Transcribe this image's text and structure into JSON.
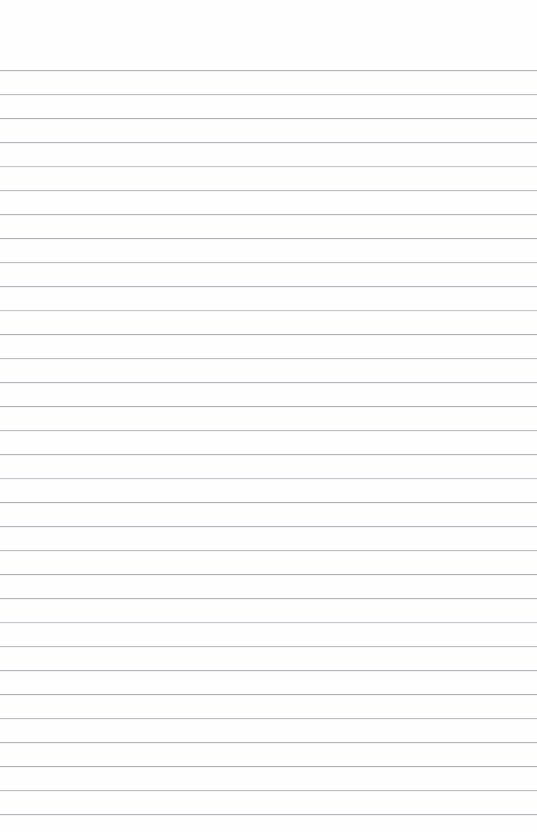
{
  "page": {
    "kind": "ruled-notebook-page",
    "width": 537,
    "height": 832,
    "background_color": "#fefefe",
    "content_text": "",
    "has_written_content": false
  },
  "ruling": {
    "line_color": "#b3b7bb",
    "line_thickness_px": 1,
    "line_spacing_px": 24,
    "first_line_y_px": 70,
    "last_line_y_px": 814,
    "line_count": 32,
    "line_left_x_px": 0,
    "line_right_x_px": 537,
    "top_margin_px": 68,
    "bottom_margin_px": 18,
    "lines": [
      {
        "index": 1,
        "y": 70,
        "tone": "tone-a"
      },
      {
        "index": 2,
        "y": 94,
        "tone": "tone-b"
      },
      {
        "index": 3,
        "y": 118,
        "tone": "tone-c"
      },
      {
        "index": 4,
        "y": 142,
        "tone": "tone-a"
      },
      {
        "index": 5,
        "y": 166,
        "tone": "tone-d"
      },
      {
        "index": 6,
        "y": 190,
        "tone": "tone-b"
      },
      {
        "index": 7,
        "y": 214,
        "tone": "tone-a"
      },
      {
        "index": 8,
        "y": 238,
        "tone": "tone-c"
      },
      {
        "index": 9,
        "y": 262,
        "tone": "tone-b"
      },
      {
        "index": 10,
        "y": 286,
        "tone": "tone-a"
      },
      {
        "index": 11,
        "y": 310,
        "tone": "tone-d"
      },
      {
        "index": 12,
        "y": 334,
        "tone": "tone-c"
      },
      {
        "index": 13,
        "y": 358,
        "tone": "tone-b"
      },
      {
        "index": 14,
        "y": 382,
        "tone": "tone-a"
      },
      {
        "index": 15,
        "y": 406,
        "tone": "tone-c"
      },
      {
        "index": 16,
        "y": 430,
        "tone": "tone-b"
      },
      {
        "index": 17,
        "y": 454,
        "tone": "tone-a"
      },
      {
        "index": 18,
        "y": 478,
        "tone": "tone-d"
      },
      {
        "index": 19,
        "y": 502,
        "tone": "tone-c"
      },
      {
        "index": 20,
        "y": 526,
        "tone": "tone-a"
      },
      {
        "index": 21,
        "y": 550,
        "tone": "tone-b"
      },
      {
        "index": 22,
        "y": 574,
        "tone": "tone-c"
      },
      {
        "index": 23,
        "y": 598,
        "tone": "tone-a"
      },
      {
        "index": 24,
        "y": 622,
        "tone": "tone-d"
      },
      {
        "index": 25,
        "y": 646,
        "tone": "tone-b"
      },
      {
        "index": 26,
        "y": 670,
        "tone": "tone-a"
      },
      {
        "index": 27,
        "y": 694,
        "tone": "tone-c"
      },
      {
        "index": 28,
        "y": 718,
        "tone": "tone-b"
      },
      {
        "index": 29,
        "y": 742,
        "tone": "tone-a"
      },
      {
        "index": 30,
        "y": 766,
        "tone": "tone-c"
      },
      {
        "index": 31,
        "y": 790,
        "tone": "tone-b"
      },
      {
        "index": 32,
        "y": 814,
        "tone": "tone-a"
      }
    ]
  }
}
